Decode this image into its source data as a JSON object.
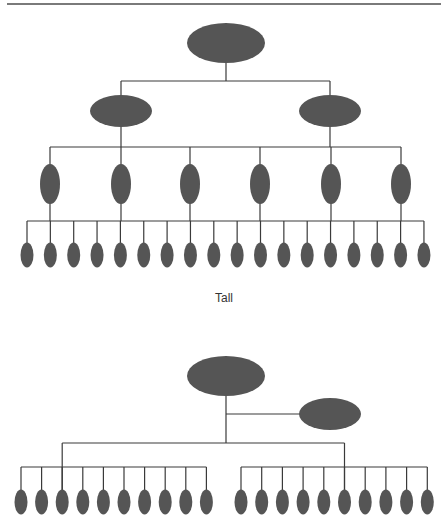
{
  "colors": {
    "node_fill": "#555555",
    "line": "#3a3a3a",
    "rule": "#7a7a7a"
  },
  "diagrams": [
    {
      "caption": "Tall",
      "structure": "4-level tall hierarchy",
      "levels": [
        {
          "count": 1,
          "y": 43,
          "rx": 39,
          "ry": 20,
          "xs": [
            226
          ]
        },
        {
          "count": 2,
          "y": 111,
          "rx": 31,
          "ry": 16,
          "xs": [
            121,
            330
          ]
        },
        {
          "count": 6,
          "y": 184,
          "rx": 10,
          "ry": 20,
          "xs": [
            50,
            121,
            190,
            260,
            331,
            401
          ]
        },
        {
          "count": 18,
          "y": 255,
          "rx": 6.5,
          "ry": 12.5,
          "x_start": 27,
          "x_step": 23.35
        }
      ],
      "bars_y": [
        81,
        147,
        221
      ]
    },
    {
      "caption": "",
      "structure": "flat hierarchy with assistant",
      "root": {
        "x": 226,
        "y": 376,
        "rx": 39,
        "ry": 20
      },
      "assistant": {
        "x": 330,
        "y": 414,
        "rx": 31,
        "ry": 16
      },
      "groups": [
        {
          "count": 10,
          "x_start": 21,
          "x_step": 20.6,
          "drop_index": 2
        },
        {
          "count": 10,
          "x_start": 241,
          "x_step": 20.7,
          "drop_index": 5
        }
      ],
      "leaf_y": 502,
      "leaf_rx": 6.5,
      "leaf_ry": 12.5,
      "upper_bar_y": 443,
      "group_bar_y": 467
    }
  ]
}
